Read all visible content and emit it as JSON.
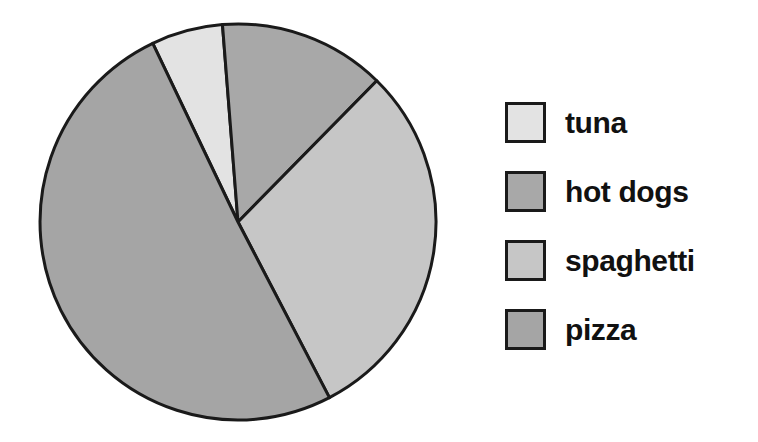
{
  "chart_data": {
    "type": "pie",
    "title": "",
    "subtitle": "",
    "xlabel": "",
    "ylabel": "",
    "grid": false,
    "legend_position": "right",
    "categories": [
      "tuna",
      "hot dogs",
      "spaghetti",
      "pizza"
    ],
    "values": [
      5.8,
      13.6,
      30.0,
      50.6
    ],
    "value_unit": "percent",
    "slice_angles_deg": [
      21,
      49,
      108,
      182
    ],
    "slices": [
      {
        "label": "tuna",
        "value": 5.8,
        "angle_deg": 21,
        "start_angle_deg": 334.5,
        "end_angle_deg": 355.5,
        "color": "#e3e3e3"
      },
      {
        "label": "hot dogs",
        "value": 13.6,
        "angle_deg": 49,
        "start_angle_deg": 355.5,
        "end_angle_deg": 44.5,
        "color": "#a8a8a8"
      },
      {
        "label": "spaghetti",
        "value": 30.0,
        "angle_deg": 108,
        "start_angle_deg": 44.5,
        "end_angle_deg": 152.5,
        "color": "#c6c6c6"
      },
      {
        "label": "pizza",
        "value": 50.6,
        "angle_deg": 182,
        "start_angle_deg": 152.5,
        "end_angle_deg": 334.5,
        "color": "#a5a5a5"
      }
    ],
    "geometry": {
      "center_x": 214,
      "center_y": 214,
      "radius": 198,
      "stroke_color": "#1a1a1a",
      "stroke_width": 3
    }
  },
  "legend": {
    "items": [
      {
        "label": "tuna",
        "color": "#e3e3e3"
      },
      {
        "label": "hot dogs",
        "color": "#a8a8a8"
      },
      {
        "label": "spaghetti",
        "color": "#c6c6c6"
      },
      {
        "label": "pizza",
        "color": "#a5a5a5"
      }
    ]
  },
  "page": {
    "background_color": "#ffffff",
    "text_color": "#111111"
  }
}
